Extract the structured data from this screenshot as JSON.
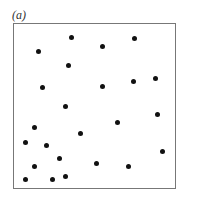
{
  "panel_label": "(a)",
  "chart_data": {
    "type": "scatter",
    "title": "(a)",
    "xlabel": "",
    "ylabel": "",
    "grid": false,
    "legend": null,
    "xlim": [
      0,
      1
    ],
    "ylim": [
      0,
      1
    ],
    "points": [
      [
        0.36,
        0.92
      ],
      [
        0.15,
        0.83
      ],
      [
        0.34,
        0.75
      ],
      [
        0.18,
        0.61
      ],
      [
        0.75,
        0.91
      ],
      [
        0.55,
        0.86
      ],
      [
        0.55,
        0.62
      ],
      [
        0.74,
        0.65
      ],
      [
        0.88,
        0.67
      ],
      [
        0.32,
        0.5
      ],
      [
        0.13,
        0.37
      ],
      [
        0.41,
        0.33
      ],
      [
        0.07,
        0.28
      ],
      [
        0.2,
        0.26
      ],
      [
        0.28,
        0.18
      ],
      [
        0.51,
        0.15
      ],
      [
        0.13,
        0.13
      ],
      [
        0.07,
        0.05
      ],
      [
        0.24,
        0.05
      ],
      [
        0.32,
        0.07
      ],
      [
        0.64,
        0.4
      ],
      [
        0.89,
        0.45
      ],
      [
        0.92,
        0.22
      ],
      [
        0.71,
        0.13
      ]
    ]
  }
}
